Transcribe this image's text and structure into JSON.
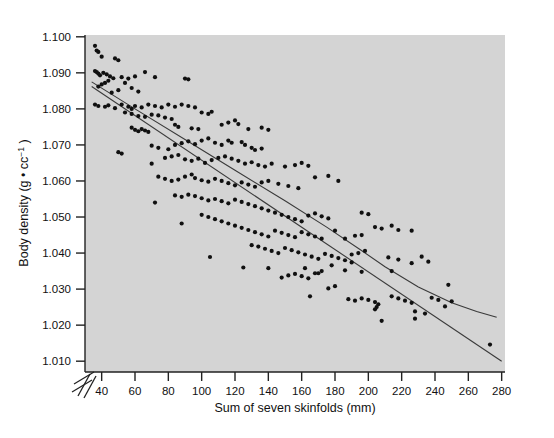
{
  "chart_data": {
    "type": "scatter",
    "title": "",
    "xlabel": "Sum of seven skinfolds (mm)",
    "ylabel": "Body density (g • cc⁻¹)",
    "xlim": [
      30,
      282
    ],
    "ylim": [
      1.007,
      1.1005
    ],
    "xticks": [
      40,
      60,
      80,
      100,
      120,
      140,
      160,
      180,
      200,
      220,
      240,
      260,
      280
    ],
    "xtick_labels": [
      "40",
      "60",
      "80",
      "100",
      "120",
      "140",
      "160",
      "180",
      "200",
      "220",
      "240",
      "260",
      "280"
    ],
    "yticks": [
      1.01,
      1.02,
      1.03,
      1.04,
      1.05,
      1.06,
      1.07,
      1.08,
      1.09,
      1.1
    ],
    "ytick_labels": [
      "1.010",
      "1.020",
      "1.030",
      "1.040",
      "1.050",
      "1.060",
      "1.070",
      "1.080",
      "1.090",
      "1.100"
    ],
    "grid": false,
    "legend": "none",
    "axis_break": {
      "axis": "y",
      "present": true,
      "note": "double slash break below 1.010"
    },
    "plot_bgcolor": "#d4d4d4",
    "page_bgcolor": "#ffffff",
    "marker": {
      "shape": "circle",
      "color": "#101010",
      "size_px": 4.2
    },
    "series": [
      {
        "name": "observations",
        "n": 252,
        "points": [
          [
            36,
            1.0975
          ],
          [
            37,
            1.0962
          ],
          [
            38,
            1.0958
          ],
          [
            40,
            1.0945
          ],
          [
            48,
            1.094
          ],
          [
            50,
            1.0935
          ],
          [
            36,
            1.0905
          ],
          [
            37,
            1.0902
          ],
          [
            38,
            1.0898
          ],
          [
            39,
            1.0893
          ],
          [
            41,
            1.09
          ],
          [
            43,
            1.0896
          ],
          [
            45,
            1.089
          ],
          [
            47,
            1.0885
          ],
          [
            44,
            1.0878
          ],
          [
            42,
            1.0872
          ],
          [
            40,
            1.0868
          ],
          [
            38,
            1.0862
          ],
          [
            52,
            1.0888
          ],
          [
            56,
            1.0884
          ],
          [
            60,
            1.089
          ],
          [
            66,
            1.0902
          ],
          [
            72,
            1.0888
          ],
          [
            90,
            1.0884
          ],
          [
            92,
            1.0882
          ],
          [
            54,
            1.0872
          ],
          [
            58,
            1.0858
          ],
          [
            62,
            1.0848
          ],
          [
            50,
            1.0852
          ],
          [
            46,
            1.0845
          ],
          [
            36,
            1.0812
          ],
          [
            38,
            1.0808
          ],
          [
            42,
            1.0806
          ],
          [
            44,
            1.081
          ],
          [
            48,
            1.0802
          ],
          [
            52,
            1.0812
          ],
          [
            56,
            1.0806
          ],
          [
            58,
            1.08
          ],
          [
            60,
            1.0808
          ],
          [
            64,
            1.0804
          ],
          [
            68,
            1.0812
          ],
          [
            72,
            1.0808
          ],
          [
            76,
            1.0804
          ],
          [
            80,
            1.0812
          ],
          [
            84,
            1.0806
          ],
          [
            88,
            1.0812
          ],
          [
            92,
            1.0808
          ],
          [
            96,
            1.0804
          ],
          [
            54,
            1.079
          ],
          [
            58,
            1.0786
          ],
          [
            62,
            1.078
          ],
          [
            66,
            1.0778
          ],
          [
            70,
            1.0784
          ],
          [
            74,
            1.0782
          ],
          [
            78,
            1.0776
          ],
          [
            82,
            1.0772
          ],
          [
            100,
            1.079
          ],
          [
            104,
            1.0786
          ],
          [
            106,
            1.0792
          ],
          [
            58,
            1.0748
          ],
          [
            60,
            1.0742
          ],
          [
            62,
            1.0738
          ],
          [
            64,
            1.0744
          ],
          [
            66,
            1.074
          ],
          [
            68,
            1.0736
          ],
          [
            84,
            1.0756
          ],
          [
            86,
            1.075
          ],
          [
            94,
            1.0746
          ],
          [
            98,
            1.0744
          ],
          [
            112,
            1.0756
          ],
          [
            116,
            1.0762
          ],
          [
            120,
            1.0768
          ],
          [
            122,
            1.0758
          ],
          [
            128,
            1.0744
          ],
          [
            136,
            1.0748
          ],
          [
            140,
            1.0742
          ],
          [
            50,
            1.068
          ],
          [
            52,
            1.0676
          ],
          [
            70,
            1.0698
          ],
          [
            74,
            1.0692
          ],
          [
            80,
            1.0688
          ],
          [
            84,
            1.07
          ],
          [
            88,
            1.0705
          ],
          [
            92,
            1.071
          ],
          [
            96,
            1.0702
          ],
          [
            100,
            1.0712
          ],
          [
            104,
            1.0718
          ],
          [
            108,
            1.0706
          ],
          [
            112,
            1.07
          ],
          [
            116,
            1.0712
          ],
          [
            118,
            1.0706
          ],
          [
            124,
            1.0708
          ],
          [
            126,
            1.07
          ],
          [
            130,
            1.0692
          ],
          [
            132,
            1.0686
          ],
          [
            136,
            1.069
          ],
          [
            78,
            1.0664
          ],
          [
            82,
            1.0668
          ],
          [
            86,
            1.0672
          ],
          [
            90,
            1.066
          ],
          [
            94,
            1.0656
          ],
          [
            98,
            1.0662
          ],
          [
            102,
            1.065
          ],
          [
            106,
            1.0658
          ],
          [
            110,
            1.0664
          ],
          [
            114,
            1.0668
          ],
          [
            118,
            1.0662
          ],
          [
            122,
            1.0656
          ],
          [
            126,
            1.0648
          ],
          [
            130,
            1.0652
          ],
          [
            134,
            1.0644
          ],
          [
            138,
            1.064
          ],
          [
            142,
            1.0648
          ],
          [
            150,
            1.064
          ],
          [
            156,
            1.0644
          ],
          [
            160,
            1.065
          ],
          [
            164,
            1.0642
          ],
          [
            70,
            1.0648
          ],
          [
            74,
            1.0612
          ],
          [
            78,
            1.0606
          ],
          [
            82,
            1.06
          ],
          [
            86,
            1.0604
          ],
          [
            90,
            1.0612
          ],
          [
            94,
            1.0618
          ],
          [
            96,
            1.0608
          ],
          [
            100,
            1.0602
          ],
          [
            104,
            1.0598
          ],
          [
            108,
            1.0606
          ],
          [
            112,
            1.06
          ],
          [
            116,
            1.0594
          ],
          [
            120,
            1.0588
          ],
          [
            124,
            1.0596
          ],
          [
            128,
            1.059
          ],
          [
            132,
            1.0584
          ],
          [
            136,
            1.0596
          ],
          [
            140,
            1.06
          ],
          [
            146,
            1.0592
          ],
          [
            152,
            1.0586
          ],
          [
            158,
            1.058
          ],
          [
            168,
            1.061
          ],
          [
            176,
            1.0614
          ],
          [
            182,
            1.06
          ],
          [
            72,
            1.054
          ],
          [
            84,
            1.056
          ],
          [
            88,
            1.0556
          ],
          [
            92,
            1.0562
          ],
          [
            96,
            1.0558
          ],
          [
            100,
            1.0552
          ],
          [
            104,
            1.0546
          ],
          [
            108,
            1.055
          ],
          [
            112,
            1.0544
          ],
          [
            116,
            1.0538
          ],
          [
            120,
            1.0548
          ],
          [
            124,
            1.0542
          ],
          [
            128,
            1.0536
          ],
          [
            132,
            1.053
          ],
          [
            136,
            1.0524
          ],
          [
            140,
            1.0518
          ],
          [
            144,
            1.0512
          ],
          [
            148,
            1.0506
          ],
          [
            152,
            1.05
          ],
          [
            156,
            1.0494
          ],
          [
            160,
            1.0488
          ],
          [
            164,
            1.0504
          ],
          [
            168,
            1.051
          ],
          [
            172,
            1.0502
          ],
          [
            176,
            1.0496
          ],
          [
            88,
            1.0482
          ],
          [
            100,
            1.0506
          ],
          [
            104,
            1.05
          ],
          [
            108,
            1.0494
          ],
          [
            112,
            1.0488
          ],
          [
            116,
            1.0482
          ],
          [
            120,
            1.0476
          ],
          [
            124,
            1.047
          ],
          [
            128,
            1.0464
          ],
          [
            132,
            1.0458
          ],
          [
            136,
            1.0452
          ],
          [
            140,
            1.0446
          ],
          [
            144,
            1.0462
          ],
          [
            148,
            1.0456
          ],
          [
            152,
            1.045
          ],
          [
            156,
            1.0444
          ],
          [
            160,
            1.0458
          ],
          [
            164,
            1.0452
          ],
          [
            168,
            1.0446
          ],
          [
            172,
            1.044
          ],
          [
            180,
            1.0462
          ],
          [
            186,
            1.044
          ],
          [
            192,
            1.0448
          ],
          [
            196,
            1.045
          ],
          [
            196,
            1.0512
          ],
          [
            200,
            1.0508
          ],
          [
            204,
            1.0472
          ],
          [
            208,
            1.0468
          ],
          [
            214,
            1.0476
          ],
          [
            218,
            1.0464
          ],
          [
            226,
            1.0462
          ],
          [
            105,
            1.0389
          ],
          [
            125,
            1.036
          ],
          [
            130,
            1.0422
          ],
          [
            134,
            1.0418
          ],
          [
            138,
            1.0412
          ],
          [
            142,
            1.0406
          ],
          [
            146,
            1.04
          ],
          [
            150,
            1.0414
          ],
          [
            154,
            1.0408
          ],
          [
            158,
            1.0402
          ],
          [
            162,
            1.0396
          ],
          [
            166,
            1.039
          ],
          [
            170,
            1.0384
          ],
          [
            174,
            1.0398
          ],
          [
            178,
            1.0392
          ],
          [
            182,
            1.0386
          ],
          [
            186,
            1.038
          ],
          [
            190,
            1.0374
          ],
          [
            194,
            1.04
          ],
          [
            198,
            1.0406
          ],
          [
            140,
            1.0358
          ],
          [
            148,
            1.0332
          ],
          [
            152,
            1.0338
          ],
          [
            156,
            1.0342
          ],
          [
            160,
            1.0336
          ],
          [
            164,
            1.033
          ],
          [
            168,
            1.0344
          ],
          [
            172,
            1.035
          ],
          [
            176,
            1.0302
          ],
          [
            180,
            1.0308
          ],
          [
            165,
            1.028
          ],
          [
            188,
            1.0272
          ],
          [
            192,
            1.0268
          ],
          [
            196,
            1.0274
          ],
          [
            200,
            1.027
          ],
          [
            204,
            1.0264
          ],
          [
            206,
            1.0258
          ],
          [
            205,
            1.025
          ],
          [
            204,
            1.0244
          ],
          [
            208,
            1.0212
          ],
          [
            212,
            1.0388
          ],
          [
            218,
            1.0382
          ],
          [
            226,
            1.0372
          ],
          [
            232,
            1.039
          ],
          [
            236,
            1.0376
          ],
          [
            214,
            1.028
          ],
          [
            218,
            1.0274
          ],
          [
            222,
            1.0268
          ],
          [
            226,
            1.0262
          ],
          [
            228,
            1.0238
          ],
          [
            228,
            1.0218
          ],
          [
            234,
            1.0232
          ],
          [
            238,
            1.0276
          ],
          [
            242,
            1.027
          ],
          [
            246,
            1.0252
          ],
          [
            248,
            1.0312
          ],
          [
            250,
            1.0266
          ],
          [
            273,
            1.0146
          ],
          [
            214,
            1.035
          ],
          [
            196,
            1.0348
          ],
          [
            190,
            1.0396
          ],
          [
            186,
            1.0352
          ],
          [
            178,
            1.0366
          ],
          [
            170,
            1.0344
          ],
          [
            162,
            1.0358
          ]
        ]
      }
    ],
    "fits": [
      {
        "name": "linear-regression",
        "kind": "line",
        "color": "#3a3a3a",
        "endpoints": [
          [
            34,
            1.0862
          ],
          [
            280,
            1.01
          ]
        ]
      },
      {
        "name": "quadratic-fit",
        "kind": "curve",
        "color": "#3a3a3a",
        "points": [
          [
            34,
            1.0875
          ],
          [
            60,
            1.08
          ],
          [
            90,
            1.0715
          ],
          [
            120,
            1.063
          ],
          [
            150,
            1.0545
          ],
          [
            175,
            1.0472
          ],
          [
            195,
            1.041
          ],
          [
            210,
            1.0362
          ],
          [
            230,
            1.0306
          ],
          [
            250,
            1.0262
          ],
          [
            265,
            1.0238
          ],
          [
            277,
            1.0222
          ]
        ]
      }
    ]
  }
}
